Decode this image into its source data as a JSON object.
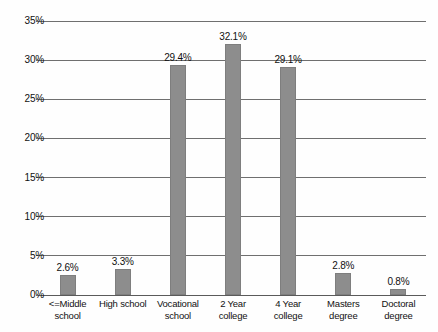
{
  "chart_data": {
    "type": "bar",
    "title": "",
    "xlabel": "",
    "ylabel": "",
    "categories": [
      "<=Middle school",
      "High school",
      "Vocational school",
      "2 Year college",
      "4 Year college",
      "Masters degree",
      "Doctoral degree"
    ],
    "category_lines": [
      [
        "<=Middle",
        "school"
      ],
      [
        "High school",
        ""
      ],
      [
        "Vocational",
        "school"
      ],
      [
        "2 Year",
        "college"
      ],
      [
        "4 Year",
        "college"
      ],
      [
        "Masters",
        "degree"
      ],
      [
        "Doctoral",
        "degree"
      ]
    ],
    "values": [
      2.6,
      3.3,
      29.4,
      32.1,
      29.1,
      2.8,
      0.8
    ],
    "value_labels": [
      "2.6%",
      "3.3%",
      "29.4%",
      "32.1%",
      "29.1%",
      "2.8%",
      "0.8%"
    ],
    "ylim": [
      0,
      35
    ],
    "ytick_values": [
      0,
      5,
      10,
      15,
      20,
      25,
      30,
      35
    ],
    "ytick_labels": [
      "0%",
      "5%",
      "10%",
      "15%",
      "20%",
      "25%",
      "30%",
      "35%"
    ],
    "grid": true,
    "legend": null,
    "bar_color": "#8d8d8d",
    "grid_color": "#6f6f6f",
    "background_color": "#fefefe"
  }
}
